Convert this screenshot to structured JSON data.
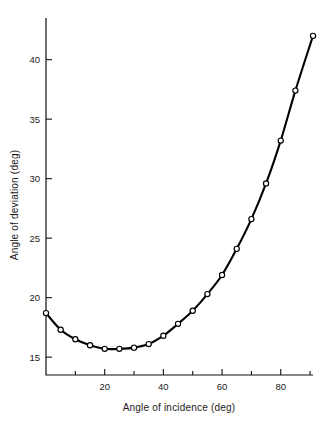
{
  "chart_data": {
    "type": "line",
    "title": "",
    "subtitle": "",
    "xlabel": "Angle of incidence (deg)",
    "ylabel": "Angle of deviation (deg)",
    "xlim": [
      0,
      91
    ],
    "ylim": [
      13.5,
      43.5
    ],
    "grid": false,
    "legend": false,
    "legend_position": "none",
    "marker": "open-circle",
    "x_major_ticks": [
      20,
      40,
      60,
      80
    ],
    "x_major_tick_labels": [
      "20",
      "40",
      "60",
      "80"
    ],
    "x_minor_ticks": [
      10,
      30,
      50,
      70,
      90
    ],
    "y_major_ticks": [
      15,
      20,
      25,
      30,
      35,
      40
    ],
    "y_major_tick_labels": [
      "15",
      "20",
      "25",
      "30",
      "35",
      "40"
    ],
    "series": [
      {
        "name": "Angle of deviation",
        "x": [
          0,
          5,
          10,
          15,
          20,
          25,
          30,
          35,
          40,
          45,
          50,
          55,
          60,
          65,
          70,
          75,
          80,
          85,
          91
        ],
        "values": [
          18.7,
          17.3,
          16.5,
          16.0,
          15.7,
          15.7,
          15.8,
          16.1,
          16.8,
          17.8,
          18.9,
          20.3,
          21.9,
          24.1,
          26.6,
          29.6,
          33.2,
          37.4,
          42.0
        ]
      }
    ],
    "annotations": []
  },
  "axis": {
    "x_title": "Angle of incidence (deg)",
    "y_title": "Angle of deviation (deg)"
  }
}
